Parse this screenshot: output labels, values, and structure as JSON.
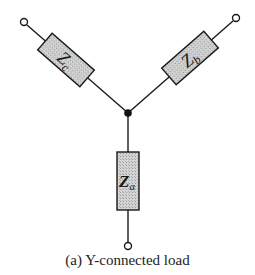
{
  "diagram": {
    "caption": "(a) Y-connected load",
    "colors": {
      "wire": "#1a1a1a",
      "box_fill": "#cfcfcf",
      "box_stroke": "#1a1a1a"
    },
    "center_node": {
      "x": 128,
      "y": 113
    },
    "branches": [
      {
        "id": "c",
        "label_main": "Z",
        "label_sub": "c",
        "terminal": {
          "x": 24,
          "y": 22
        }
      },
      {
        "id": "b",
        "label_main": "Z",
        "label_sub": "b",
        "terminal": {
          "x": 236,
          "y": 18
        }
      },
      {
        "id": "a",
        "label_main": "Z",
        "label_sub": "a",
        "terminal": {
          "x": 128,
          "y": 246
        }
      }
    ]
  }
}
